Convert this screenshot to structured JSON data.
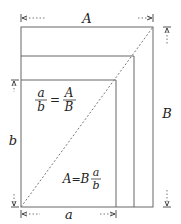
{
  "diagram": {
    "labels": {
      "top_width": "A",
      "right_height": "B",
      "left_height": "b",
      "bottom_width": "a"
    },
    "equations": {
      "ratio": {
        "lhs_num": "a",
        "lhs_den": "b",
        "op": "=",
        "rhs_num": "A",
        "rhs_den": "B"
      },
      "solution": {
        "lhs": "A",
        "op": "=",
        "coef": "B",
        "num": "a",
        "den": "b"
      }
    },
    "colors": {
      "stroke": "#555555",
      "text": "#222222",
      "background": "#ffffff"
    },
    "rectangles": [
      {
        "name": "outer",
        "x": 21,
        "y": 27,
        "w": 132,
        "h": 180
      },
      {
        "name": "middle",
        "x": 21,
        "y": 56,
        "w": 113,
        "h": 151
      },
      {
        "name": "inner",
        "x": 21,
        "y": 80,
        "w": 95,
        "h": 127
      }
    ]
  }
}
